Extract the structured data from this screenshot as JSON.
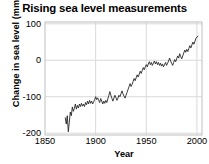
{
  "chart_data": {
    "type": "line",
    "title": "Rising sea level measurements",
    "xlabel": "Year",
    "ylabel": "Change in sea level (mm)",
    "xlim": [
      1850,
      2005
    ],
    "ylim": [
      -205,
      105
    ],
    "xticks": [
      1850,
      1900,
      1950,
      2000
    ],
    "xtick_labels": [
      "1850",
      "1900",
      "1950",
      "2000"
    ],
    "yticks": [
      100,
      0,
      -100,
      -200
    ],
    "ytick_labels": [
      "100",
      "0",
      "-100",
      "-200"
    ],
    "grid": true,
    "grid_color": "#d9d9d9",
    "line_color": "#262626",
    "background": "#ffffff",
    "legend": null,
    "series": [
      {
        "name": "Change in sea level",
        "x": [
          1870,
          1871,
          1872,
          1873,
          1874,
          1875,
          1876,
          1877,
          1878,
          1879,
          1880,
          1881,
          1882,
          1883,
          1884,
          1885,
          1886,
          1887,
          1888,
          1889,
          1890,
          1891,
          1892,
          1893,
          1894,
          1895,
          1896,
          1897,
          1898,
          1899,
          1900,
          1901,
          1902,
          1903,
          1904,
          1905,
          1906,
          1907,
          1908,
          1909,
          1910,
          1911,
          1912,
          1913,
          1914,
          1915,
          1916,
          1917,
          1918,
          1919,
          1920,
          1921,
          1922,
          1923,
          1924,
          1925,
          1926,
          1927,
          1928,
          1929,
          1930,
          1931,
          1932,
          1933,
          1934,
          1935,
          1936,
          1937,
          1938,
          1939,
          1940,
          1941,
          1942,
          1943,
          1944,
          1945,
          1946,
          1947,
          1948,
          1949,
          1950,
          1951,
          1952,
          1953,
          1954,
          1955,
          1956,
          1957,
          1958,
          1959,
          1960,
          1961,
          1962,
          1963,
          1964,
          1965,
          1966,
          1967,
          1968,
          1969,
          1970,
          1971,
          1972,
          1973,
          1974,
          1975,
          1976,
          1977,
          1978,
          1979,
          1980,
          1981,
          1982,
          1983,
          1984,
          1985,
          1986,
          1987,
          1988,
          1989,
          1990,
          1991,
          1992,
          1993,
          1994,
          1995,
          1996,
          1997,
          1998,
          1999,
          2000,
          2001
        ],
        "values": [
          -158,
          -175,
          -152,
          -196,
          -170,
          -142,
          -152,
          -128,
          -140,
          -132,
          -120,
          -134,
          -124,
          -131,
          -120,
          -127,
          -118,
          -126,
          -120,
          -127,
          -116,
          -122,
          -112,
          -120,
          -110,
          -118,
          -112,
          -120,
          -114,
          -108,
          -100,
          -108,
          -103,
          -110,
          -116,
          -105,
          -112,
          -120,
          -112,
          -118,
          -110,
          -116,
          -106,
          -97,
          -86,
          -96,
          -104,
          -112,
          -104,
          -96,
          -102,
          -110,
          -104,
          -96,
          -100,
          -92,
          -84,
          -92,
          -98,
          -104,
          -96,
          -88,
          -80,
          -72,
          -64,
          -72,
          -66,
          -58,
          -50,
          -56,
          -48,
          -40,
          -46,
          -38,
          -30,
          -36,
          -28,
          -20,
          -26,
          -18,
          -12,
          -18,
          -10,
          -4,
          -12,
          -6,
          -14,
          -8,
          -2,
          -10,
          -4,
          -12,
          -6,
          -14,
          -8,
          -16,
          -10,
          -18,
          -12,
          -6,
          -14,
          -8,
          -2,
          6,
          -2,
          -8,
          -14,
          -6,
          2,
          -4,
          4,
          12,
          6,
          18,
          10,
          4,
          12,
          20,
          28,
          22,
          30,
          24,
          32,
          40,
          34,
          42,
          50,
          44,
          52,
          60,
          64,
          66
        ]
      }
    ]
  }
}
